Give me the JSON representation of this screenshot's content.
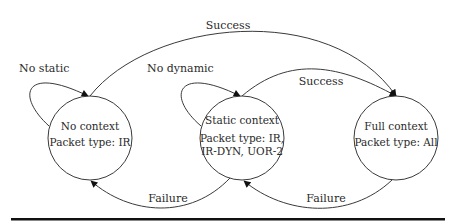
{
  "diagram": {
    "type": "state-machine",
    "states": [
      {
        "id": "no_context",
        "name": "No context",
        "packet": "Packet type: IR",
        "packet_line2": ""
      },
      {
        "id": "static_context",
        "name": "Static context",
        "packet": "Packet type: IR,",
        "packet_line2": "IR-DYN, UOR-2"
      },
      {
        "id": "full_context",
        "name": "Full context",
        "packet": "Packet type: All",
        "packet_line2": ""
      }
    ],
    "transitions": [
      {
        "from": "no_context",
        "to": "no_context",
        "label": "No static"
      },
      {
        "from": "static_context",
        "to": "static_context",
        "label": "No dynamic"
      },
      {
        "from": "no_context",
        "to": "full_context",
        "label": "Success"
      },
      {
        "from": "static_context",
        "to": "full_context",
        "label": "Success"
      },
      {
        "from": "static_context",
        "to": "no_context",
        "label": "Failure"
      },
      {
        "from": "full_context",
        "to": "static_context",
        "label": "Failure"
      }
    ],
    "colors": {
      "line": "#3a3a3a",
      "text": "#2a2a2a",
      "rule": "#111111"
    }
  }
}
